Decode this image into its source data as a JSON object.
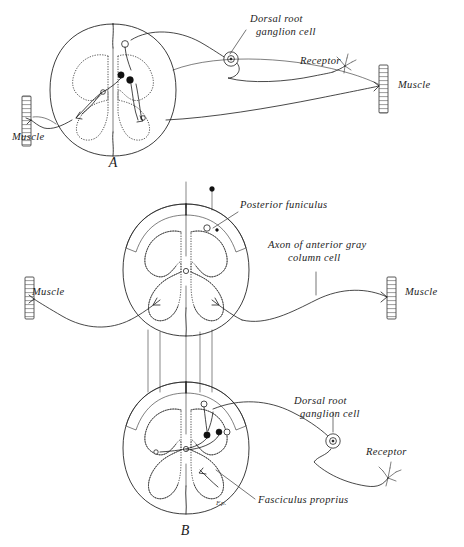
{
  "figure": {
    "background_color": "#ffffff",
    "ink_color": "#1a1a1a",
    "width": 464,
    "height": 547
  },
  "panels": [
    {
      "id": "A",
      "letter": "A",
      "letter_pos": {
        "x": 113,
        "y": 167
      },
      "description": "Single-segment reflex arc: receptor to dorsal root ganglion cell into cord, synapse, motor axon out to muscle"
    },
    {
      "id": "B",
      "letter": "B",
      "letter_pos": {
        "x": 185,
        "y": 535
      },
      "description": "Intersegmental reflex arc: fasciculus proprius links two cord levels"
    }
  ],
  "labels": [
    {
      "name": "dorsal-root-ganglion-cell-a",
      "panel": "A",
      "lines": [
        "Dorsal root",
        "ganglion cell"
      ],
      "x": 250,
      "y": 22,
      "anchor": "start",
      "leader": {
        "x1": 246,
        "y1": 30,
        "x2": 230,
        "y2": 57
      }
    },
    {
      "name": "receptor-a",
      "panel": "A",
      "lines": [
        "Receptor"
      ],
      "x": 300,
      "y": 64,
      "anchor": "start",
      "leader": null
    },
    {
      "name": "muscle-a-left",
      "panel": "A",
      "lines": [
        "Muscle"
      ],
      "x": 12,
      "y": 140,
      "anchor": "start",
      "leader": null
    },
    {
      "name": "muscle-a-right",
      "panel": "A",
      "lines": [
        "Muscle"
      ],
      "x": 398,
      "y": 88,
      "anchor": "start",
      "leader": null
    },
    {
      "name": "posterior-funiculus",
      "panel": "B",
      "lines": [
        "Posterior funiculus"
      ],
      "x": 240,
      "y": 208,
      "anchor": "start",
      "leader": {
        "x1": 238,
        "y1": 212,
        "x2": 212,
        "y2": 228
      }
    },
    {
      "name": "axon-of-anterior-gray-column-cell",
      "panel": "B",
      "lines": [
        "Axon of anterior gray",
        "column cell"
      ],
      "x": 268,
      "y": 248,
      "anchor": "start",
      "leader": {
        "x1": 316,
        "y1": 272,
        "x2": 316,
        "y2": 293
      }
    },
    {
      "name": "muscle-b-left",
      "panel": "B",
      "lines": [
        "Muscle"
      ],
      "x": 32,
      "y": 295,
      "anchor": "start",
      "leader": null
    },
    {
      "name": "muscle-b-right",
      "panel": "B",
      "lines": [
        "Muscle"
      ],
      "x": 405,
      "y": 295,
      "anchor": "start",
      "leader": null
    },
    {
      "name": "dorsal-root-ganglion-cell-b",
      "panel": "B",
      "lines": [
        "Dorsal root",
        "ganglion cell"
      ],
      "x": 294,
      "y": 404,
      "anchor": "start",
      "leader": {
        "x1": 333,
        "y1": 412,
        "x2": 333,
        "y2": 432
      }
    },
    {
      "name": "receptor-b",
      "panel": "B",
      "lines": [
        "Receptor"
      ],
      "x": 366,
      "y": 455,
      "anchor": "start",
      "leader": null
    },
    {
      "name": "fasciculus-proprius",
      "panel": "B",
      "lines": [
        "Fasciculus proprius"
      ],
      "x": 258,
      "y": 503,
      "anchor": "start",
      "leader": {
        "x1": 255,
        "y1": 499,
        "x2": 215,
        "y2": 470
      }
    }
  ],
  "muscle_icons": [
    {
      "name": "muscle-icon-a-left",
      "x": 22,
      "y": 96,
      "w": 9,
      "h": 50
    },
    {
      "name": "muscle-icon-a-right",
      "x": 379,
      "y": 65,
      "w": 9,
      "h": 48
    },
    {
      "name": "muscle-icon-b-left",
      "x": 25,
      "y": 277,
      "w": 9,
      "h": 42
    },
    {
      "name": "muscle-icon-b-right",
      "x": 387,
      "y": 277,
      "w": 9,
      "h": 42
    }
  ],
  "ganglion_cells": [
    {
      "name": "ganglion-cell-a",
      "cx": 231,
      "cy": 59,
      "r": 7
    },
    {
      "name": "ganglion-cell-b",
      "cx": 333,
      "cy": 441,
      "r": 7
    }
  ],
  "receptors": [
    {
      "name": "receptor-endings-a",
      "x": 332,
      "y": 72
    },
    {
      "name": "receptor-endings-b",
      "x": 388,
      "y": 478
    }
  ],
  "cord_sections": [
    {
      "name": "cord-section-a",
      "cx": 113,
      "cy": 90,
      "rx": 62,
      "ry": 66,
      "has_funiculus": false
    },
    {
      "name": "cord-section-b-upper",
      "cx": 186,
      "cy": 270,
      "rx": 62,
      "ry": 66,
      "has_funiculus": true
    },
    {
      "name": "cord-section-b-lower",
      "cx": 186,
      "cy": 448,
      "rx": 62,
      "ry": 66,
      "has_funiculus": true
    }
  ],
  "annotations": {
    "fasciculus_mark_b": "F.p."
  }
}
